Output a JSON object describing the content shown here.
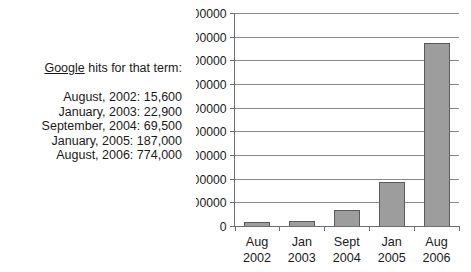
{
  "caption": {
    "heading_term": "Google",
    "heading_rest": " hits for that term:",
    "hits": [
      "August, 2002: 15,600",
      "January, 2003: 22,900",
      "September, 2004: 69,500",
      "January, 2005: 187,000",
      "August, 2006: 774,000"
    ]
  },
  "chart_data": {
    "type": "bar",
    "title": "",
    "xlabel": "",
    "ylabel": "",
    "categories": [
      "Aug\n2002",
      "Jan\n2003",
      "Sept\n2004",
      "Jan\n2005",
      "Aug\n2006"
    ],
    "category_lines": [
      {
        "month": "Aug",
        "year": "2002"
      },
      {
        "month": "Jan",
        "year": "2003"
      },
      {
        "month": "Sept",
        "year": "2004"
      },
      {
        "month": "Jan",
        "year": "2005"
      },
      {
        "month": "Aug",
        "year": "2006"
      }
    ],
    "values": [
      15600,
      22900,
      69500,
      187000,
      774000
    ],
    "ylim": [
      0,
      900000
    ],
    "ytick_labels": [
      "900000",
      "800000",
      "700000",
      "600000",
      "500000",
      "400000",
      "300000",
      "200000",
      "100000",
      "0"
    ],
    "ytick_values": [
      900000,
      800000,
      700000,
      600000,
      500000,
      400000,
      300000,
      200000,
      100000,
      0
    ],
    "grid": true,
    "legend": false,
    "bar_fill": "#9d9d9d",
    "bar_stroke": "#5a5a5a"
  }
}
